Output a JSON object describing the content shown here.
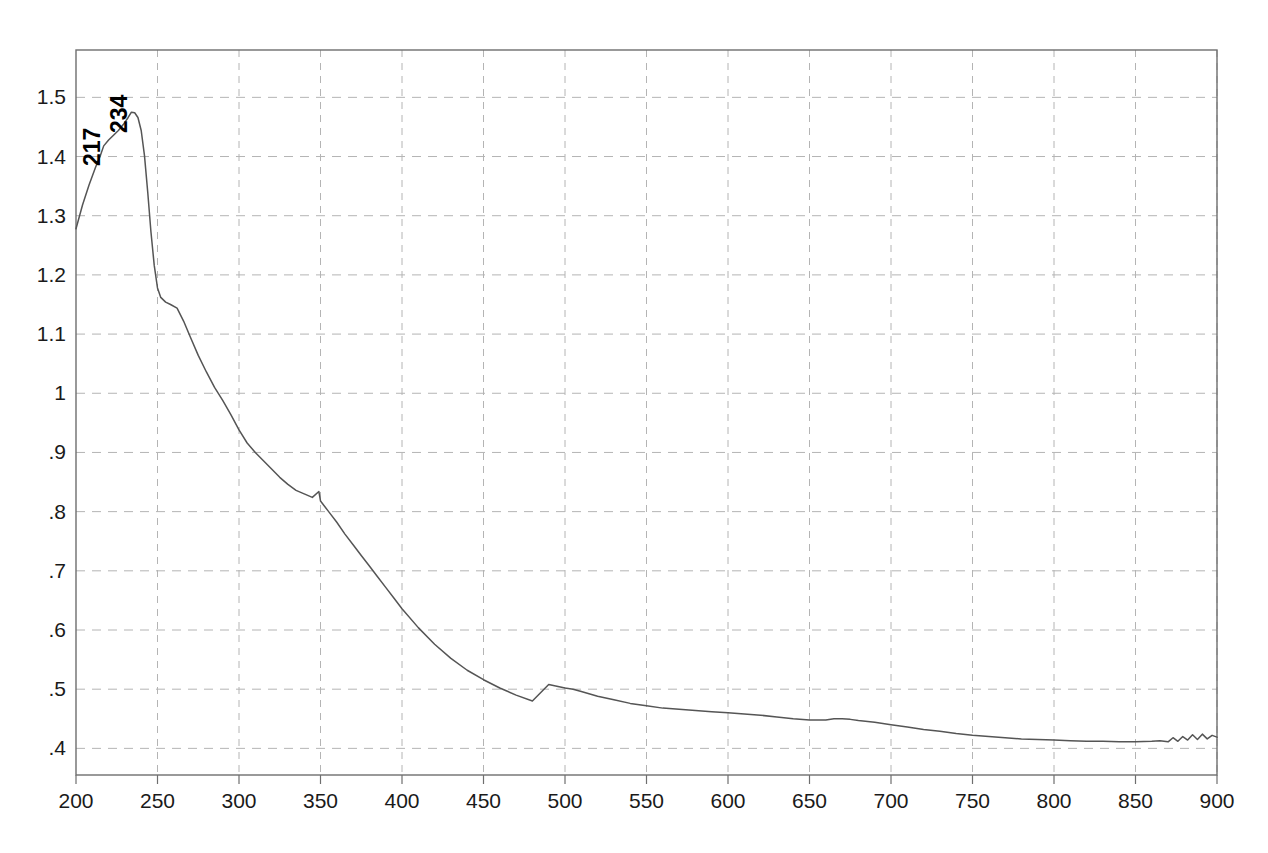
{
  "chart_data": {
    "type": "line",
    "title": "",
    "subtitle": "",
    "xlabel": "",
    "ylabel": "",
    "xlim": [
      200,
      900
    ],
    "ylim": [
      0.355,
      1.58
    ],
    "grid": true,
    "legend": "none",
    "x_ticks": [
      200,
      250,
      300,
      350,
      400,
      450,
      500,
      550,
      600,
      650,
      700,
      750,
      800,
      850,
      900
    ],
    "x_tick_labels": [
      "200",
      "250",
      "300",
      "350",
      "400",
      "450",
      "500",
      "550",
      "600",
      "650",
      "700",
      "750",
      "800",
      "850",
      "900"
    ],
    "y_ticks": [
      0.4,
      0.5,
      0.6,
      0.7,
      0.8,
      0.9,
      1.0,
      1.1,
      1.2,
      1.3,
      1.4,
      1.5
    ],
    "y_tick_labels": [
      ".4",
      ".5",
      ".6",
      ".7",
      ".8",
      ".9",
      "1",
      "1.1",
      "1.2",
      "1.3",
      "1.4",
      "1.5"
    ],
    "annotations": [
      {
        "text": "217",
        "x": 217,
        "y": 1.42,
        "rotation": -90
      },
      {
        "text": "234",
        "x": 234,
        "y": 1.475,
        "rotation": -90
      }
    ],
    "series": [
      {
        "name": "absorbance",
        "color": "#555555",
        "x": [
          200,
          204,
          208,
          212,
          215,
          217,
          220,
          223,
          226,
          229,
          232,
          234,
          236,
          238,
          240,
          242,
          244,
          246,
          248,
          250,
          252,
          255,
          258,
          262,
          266,
          270,
          275,
          280,
          285,
          290,
          295,
          300,
          305,
          310,
          315,
          320,
          325,
          330,
          335,
          340,
          345,
          349,
          350,
          355,
          360,
          365,
          370,
          375,
          380,
          385,
          390,
          395,
          400,
          410,
          420,
          430,
          440,
          450,
          460,
          470,
          480,
          490,
          500,
          505,
          510,
          520,
          530,
          540,
          550,
          560,
          570,
          580,
          590,
          600,
          610,
          620,
          630,
          640,
          650,
          660,
          665,
          670,
          675,
          680,
          690,
          700,
          710,
          720,
          730,
          740,
          750,
          760,
          770,
          780,
          790,
          800,
          810,
          820,
          830,
          840,
          850,
          860,
          865,
          870,
          873,
          876,
          879,
          882,
          885,
          888,
          891,
          894,
          897,
          900
        ],
        "y": [
          1.278,
          1.318,
          1.352,
          1.382,
          1.402,
          1.418,
          1.428,
          1.436,
          1.444,
          1.454,
          1.466,
          1.475,
          1.474,
          1.466,
          1.444,
          1.402,
          1.34,
          1.272,
          1.216,
          1.178,
          1.162,
          1.154,
          1.15,
          1.144,
          1.122,
          1.096,
          1.064,
          1.036,
          1.01,
          0.988,
          0.964,
          0.938,
          0.916,
          0.9,
          0.886,
          0.872,
          0.858,
          0.846,
          0.836,
          0.83,
          0.824,
          0.834,
          0.818,
          0.8,
          0.782,
          0.762,
          0.744,
          0.726,
          0.708,
          0.69,
          0.672,
          0.654,
          0.636,
          0.604,
          0.576,
          0.552,
          0.532,
          0.516,
          0.502,
          0.49,
          0.48,
          0.508,
          0.502,
          0.5,
          0.496,
          0.488,
          0.482,
          0.476,
          0.472,
          0.468,
          0.466,
          0.464,
          0.462,
          0.46,
          0.458,
          0.456,
          0.453,
          0.45,
          0.448,
          0.448,
          0.45,
          0.45,
          0.449,
          0.447,
          0.444,
          0.44,
          0.436,
          0.432,
          0.429,
          0.425,
          0.422,
          0.42,
          0.418,
          0.416,
          0.415,
          0.414,
          0.413,
          0.412,
          0.412,
          0.411,
          0.411,
          0.412,
          0.413,
          0.411,
          0.418,
          0.412,
          0.42,
          0.414,
          0.423,
          0.415,
          0.424,
          0.416,
          0.422,
          0.419
        ]
      }
    ],
    "features": {
      "peak_primary": {
        "x": 234,
        "y": 1.475
      },
      "shoulder": {
        "x": 217,
        "y": 1.42
      },
      "secondary_shoulder": {
        "x": 262,
        "y": 1.15
      },
      "lamp_change_artifact": {
        "x": 350,
        "y": 0.82
      },
      "plateau": {
        "x_range": [
          650,
          680
        ],
        "y": 0.448
      },
      "noise_onset": {
        "x": 870
      }
    },
    "style": {
      "line_color": "#555555",
      "grid_color": "#b4b4b4",
      "axis_color": "#6e6e6e",
      "background": "#ffffff",
      "text_color": "#1a1a1a"
    }
  }
}
